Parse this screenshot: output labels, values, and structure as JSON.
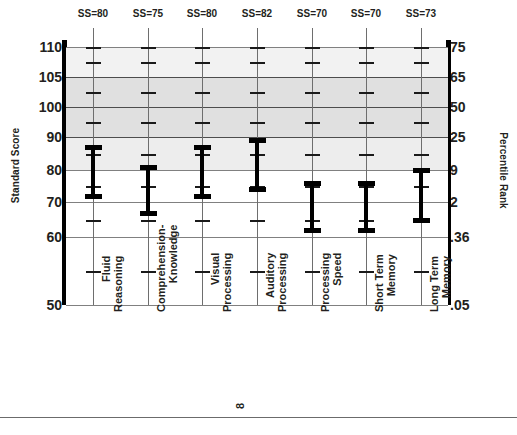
{
  "chart_data": {
    "type": "bar",
    "title": "",
    "xlabel": "",
    "ylabel": "Standard Score",
    "y2label": "Percentile Rank",
    "ylim": [
      50,
      110
    ],
    "grid": true,
    "legend": "none",
    "note": "Confidence-interval (error bar) plot; each category shows a standard-score point range with upper and lower bounds on a non-linear normal-curve axis.",
    "categories": [
      "Fluid Reasoning",
      "Comprehension-Knowledge",
      "Visual Processing",
      "Auditory Processing",
      "Processing Speed",
      "Short Term Memory",
      "Long Term Memory"
    ],
    "category_lines": [
      [
        "Fluid",
        "Reasoning"
      ],
      [
        "Comprehension-",
        "Knowledge"
      ],
      [
        "Visual",
        "Processing"
      ],
      [
        "Auditory",
        "Processing"
      ],
      [
        "Processing",
        "Speed"
      ],
      [
        "Short Term",
        "Memory"
      ],
      [
        "Long Term",
        "Memory"
      ]
    ],
    "standard_scores": [
      80,
      75,
      80,
      82,
      70,
      70,
      73
    ],
    "score_labels": [
      "SS=80",
      "SS=75",
      "SS=80",
      "SS=82",
      "SS=70",
      "SS=70",
      "SS=73"
    ],
    "confidence_intervals": [
      {
        "category": "Fluid Reasoning",
        "low": 72,
        "high": 87
      },
      {
        "category": "Comprehension-Knowledge",
        "low": 67,
        "high": 81
      },
      {
        "category": "Visual Processing",
        "low": 72,
        "high": 87
      },
      {
        "category": "Auditory Processing",
        "low": 74,
        "high": 89
      },
      {
        "category": "Processing Speed",
        "low": 62,
        "high": 76
      },
      {
        "category": "Short Term Memory",
        "low": 62,
        "high": 76
      },
      {
        "category": "Long Term Memory",
        "low": 65,
        "high": 80
      }
    ],
    "y_ticks_left": [
      "110",
      "105",
      "100",
      "90",
      "80",
      "70",
      "60",
      "50"
    ],
    "y_ticks_right": [
      "75",
      "65",
      "50",
      "25",
      "9",
      "2",
      ".36",
      ".05"
    ],
    "y_tick_values": [
      110,
      105,
      100,
      90,
      80,
      70,
      60,
      50
    ]
  },
  "axes": {
    "left_title": "Standard Score",
    "right_title": "Percentile Rank"
  },
  "footer": {
    "page_number": "8",
    "caption": ""
  },
  "colors": {
    "band_lightest": "#f2f2f2",
    "band_light": "#ededed",
    "band_medium": "#e0e0e0",
    "band_white": "#ffffff",
    "gridline": "#808080",
    "gridline_major": "#4d4d4d",
    "frame": "#000000",
    "bar": "#000000",
    "text": "#231f20"
  }
}
